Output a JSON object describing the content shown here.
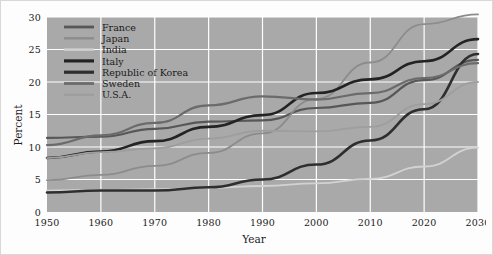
{
  "chart_data": {
    "type": "line",
    "title": "",
    "xlabel": "Year",
    "ylabel": "Percent",
    "xlim": [
      1950,
      2030
    ],
    "ylim": [
      0,
      30
    ],
    "xticks": [
      1950,
      1960,
      1970,
      1980,
      1990,
      2000,
      2010,
      2020,
      2030
    ],
    "yticks": [
      0,
      5,
      10,
      15,
      20,
      25,
      30
    ],
    "grid": true,
    "legend_position": "top-left-inside",
    "plot_background": "#a9a9a9",
    "gridline_color": "#ffffff",
    "x": [
      1950,
      1960,
      1970,
      1980,
      1990,
      2000,
      2010,
      2020,
      2030
    ],
    "series": [
      {
        "name": "France",
        "color": "#575757",
        "width": 2.2,
        "values": [
          11.4,
          11.6,
          12.8,
          13.9,
          14.1,
          16.0,
          16.8,
          20.3,
          23.4
        ]
      },
      {
        "name": "Japan",
        "color": "#8c8c8c",
        "width": 1.8,
        "values": [
          4.9,
          5.7,
          7.1,
          9.1,
          12.1,
          17.4,
          23.0,
          28.9,
          30.4
        ]
      },
      {
        "name": "India",
        "color": "#d2d2d2",
        "width": 1.8,
        "values": [
          3.3,
          3.4,
          3.5,
          3.7,
          4.0,
          4.4,
          5.1,
          7.0,
          9.9
        ]
      },
      {
        "name": "Italy",
        "color": "#232323",
        "width": 2.6,
        "values": [
          8.3,
          9.3,
          10.9,
          13.1,
          14.9,
          18.3,
          20.4,
          23.2,
          26.6
        ]
      },
      {
        "name": "Republic of Korea",
        "color": "#2e2e2e",
        "width": 2.6,
        "values": [
          3.0,
          3.3,
          3.3,
          3.8,
          5.0,
          7.3,
          11.0,
          15.8,
          24.3
        ]
      },
      {
        "name": "Sweden",
        "color": "#6b6b6b",
        "width": 2.2,
        "values": [
          10.3,
          11.8,
          13.7,
          16.4,
          17.8,
          17.3,
          18.3,
          20.6,
          22.9
        ]
      },
      {
        "name": "U.S.A.",
        "color": "#9e9e9e",
        "width": 1.8,
        "values": [
          8.3,
          9.2,
          9.8,
          11.3,
          12.5,
          12.4,
          13.1,
          16.6,
          20.0
        ]
      }
    ]
  },
  "legend": {
    "entries": [
      {
        "label": "France"
      },
      {
        "label": "Japan"
      },
      {
        "label": "India"
      },
      {
        "label": "Italy"
      },
      {
        "label": "Republic of Korea"
      },
      {
        "label": "Sweden"
      },
      {
        "label": "U.S.A."
      }
    ]
  },
  "axes": {
    "y_title": "Percent",
    "x_title": "Year"
  }
}
